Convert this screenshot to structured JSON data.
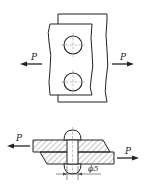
{
  "diagram": {
    "top_view": {
      "load_left_label": "P",
      "load_right_label": "P",
      "rivet_count": 2
    },
    "section_view": {
      "load_left_label": "P",
      "load_right_label": "P",
      "rivet_diameter_label": "ϕ5"
    },
    "colors": {
      "line": "#222222",
      "hatch": "#555555",
      "centerline": "#888888",
      "background": "#ffffff"
    }
  }
}
